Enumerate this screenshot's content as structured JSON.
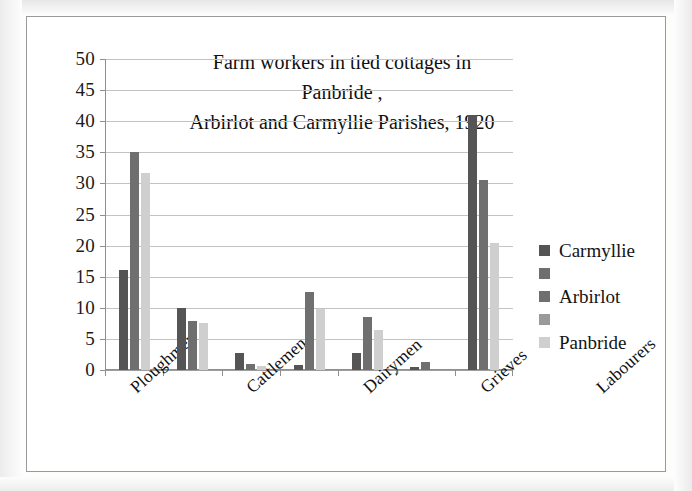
{
  "figure": {
    "title_line1": "Farm workers in tied cottages in Panbride ,",
    "title_line2": "Arbirlot and Carmyllie Parishes, 1920"
  },
  "legend": {
    "position": "right",
    "rows": [
      {
        "label": "Carmyllie",
        "color": "#555555"
      },
      {
        "label": "",
        "color": "#6f6f6f"
      },
      {
        "label": "Arbirlot",
        "color": "#6f6f6f"
      },
      {
        "label": "",
        "color": "#9a9a9a"
      },
      {
        "label": "Panbride",
        "color": "#cfcfcf"
      }
    ]
  },
  "axes": {
    "y_ticks": [
      "0",
      "5",
      "10",
      "15",
      "20",
      "25",
      "30",
      "35",
      "40",
      "45",
      "50"
    ],
    "y_min": 0,
    "y_max": 50,
    "y_step": 5,
    "grid": true
  },
  "chart_data": {
    "type": "bar",
    "title": "Farm workers in tied cottages in Panbride , Arbirlot and Carmyllie Parishes, 1920",
    "xlabel": "",
    "ylabel": "",
    "ylim": [
      0,
      50
    ],
    "ytick_step": 5,
    "grid": true,
    "legend_position": "right",
    "categories": [
      "Ploughmen",
      "Cattlemen",
      "Dairymen",
      "Grieves",
      "Labourers",
      "Shepherds",
      "No of Farms"
    ],
    "series": [
      {
        "name": "Carmyllie",
        "color": "#555555",
        "values": [
          16,
          10,
          2.8,
          0.8,
          2.7,
          0.5,
          41
        ]
      },
      {
        "name": "Arbirlot",
        "color": "#6f6f6f",
        "values": [
          35,
          7.8,
          0.9,
          12.5,
          8.6,
          1.3,
          30.6
        ]
      },
      {
        "name": "Panbride",
        "color": "#cfcfcf",
        "values": [
          31.7,
          7.6,
          0.6,
          9.8,
          6.5,
          0,
          20.5
        ]
      }
    ]
  }
}
